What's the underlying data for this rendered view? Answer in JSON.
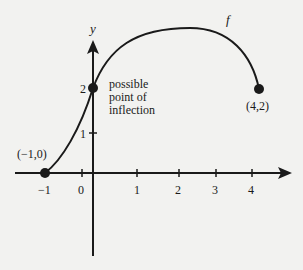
{
  "figure": {
    "function_label": "f",
    "y_axis_label": "y",
    "x_ticks": [
      "−1",
      "0",
      "1",
      "2",
      "3",
      "4"
    ],
    "y_ticks": [
      "1",
      "2"
    ],
    "points": {
      "left_endpoint": "(−1,0)",
      "right_endpoint": "(4,2)"
    },
    "annotation": {
      "line1": "possible",
      "line2": "point of",
      "line3": "inflection"
    },
    "colors": {
      "ink": "#1a1a1a",
      "background": "#f2f2f0"
    }
  }
}
